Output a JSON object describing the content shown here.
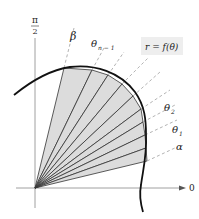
{
  "diagram": {
    "axes": {
      "vertical_label_num": "π",
      "vertical_label_den": "2",
      "horizontal_label": "0"
    },
    "curve_label": "r = f(θ)",
    "ray_labels": {
      "beta": "β",
      "theta_n_minus_1": "θ",
      "theta_n_minus_1_sub": "n − 1",
      "theta_2": "θ",
      "theta_2_sub": "2",
      "theta_1": "θ",
      "theta_1_sub": "1",
      "alpha": "α"
    },
    "colors": {
      "sector_fill": "#d9d9d9",
      "curve": "#111111",
      "axis": "#777777",
      "dashed_ray": "#aaaaaa",
      "label_box": "#eeeeee"
    }
  }
}
